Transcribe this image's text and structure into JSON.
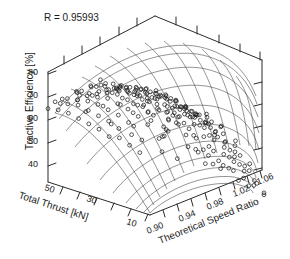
{
  "annotation": {
    "correlation_label": "R = 0.95993"
  },
  "chart_data": {
    "type": "scatter",
    "plot_style": "3d-surface-wireframe-with-scatter",
    "title": "",
    "subtitle": "",
    "annotations": [
      "R = 0.95993"
    ],
    "xlabel": "Theoretical Speed Ratio",
    "ylabel": "Total Thrust [kN]",
    "zlabel": "Tractive Efficiency [%]",
    "xticks": [
      "0.90",
      "0.94",
      "0.98",
      "1.02",
      "1.06"
    ],
    "xtick_values": [
      0.9,
      0.94,
      0.98,
      1.02,
      1.06
    ],
    "yticks": [
      "50",
      "30",
      "10"
    ],
    "ytick_values": [
      50,
      30,
      10
    ],
    "zticks": [
      "40",
      "50",
      "60",
      "70",
      "80"
    ],
    "ztick_values": [
      40,
      50,
      60,
      70,
      80
    ],
    "xlim": [
      0.9,
      1.06
    ],
    "ylim": [
      10,
      50
    ],
    "zlim": [
      35,
      88
    ],
    "grid": true,
    "legend": null,
    "legend_position": "none",
    "surface": {
      "description": "Fitted response surface of tractive efficiency; rises to a broad ridge near speed ratio 0.96-1.00 and falls steeply toward speed ratio 1.06",
      "n_u": 13,
      "n_v": 11,
      "peak_efficiency": 86,
      "min_efficiency": 38
    },
    "series": [
      {
        "name": "Measured data",
        "marker": "open-circle",
        "n_points": 196,
        "points": [
          [
            0.9,
            50,
            71
          ],
          [
            0.91,
            50,
            74
          ],
          [
            0.92,
            48,
            76
          ],
          [
            0.93,
            46,
            78
          ],
          [
            0.94,
            45,
            79
          ],
          [
            0.95,
            44,
            80
          ],
          [
            0.96,
            43,
            81
          ],
          [
            0.97,
            42,
            81
          ],
          [
            0.98,
            41,
            80
          ],
          [
            0.99,
            40,
            79
          ],
          [
            1.0,
            39,
            77
          ],
          [
            1.01,
            38,
            74
          ],
          [
            1.02,
            37,
            70
          ],
          [
            1.03,
            36,
            65
          ],
          [
            1.04,
            35,
            59
          ],
          [
            1.05,
            34,
            52
          ],
          [
            1.06,
            33,
            45
          ],
          [
            0.9,
            46,
            72
          ],
          [
            0.91,
            45,
            75
          ],
          [
            0.92,
            44,
            77
          ],
          [
            0.93,
            43,
            79
          ],
          [
            0.94,
            42,
            80
          ],
          [
            0.95,
            41,
            82
          ],
          [
            0.96,
            40,
            83
          ],
          [
            0.97,
            39,
            83
          ],
          [
            0.98,
            38,
            82
          ],
          [
            0.99,
            37,
            81
          ],
          [
            1.0,
            36,
            78
          ],
          [
            1.01,
            35,
            75
          ],
          [
            1.02,
            34,
            71
          ],
          [
            1.03,
            33,
            66
          ],
          [
            1.04,
            32,
            60
          ],
          [
            1.05,
            31,
            53
          ],
          [
            1.06,
            30,
            46
          ],
          [
            0.9,
            42,
            72
          ],
          [
            0.91,
            41,
            76
          ],
          [
            0.92,
            40,
            78
          ],
          [
            0.93,
            39,
            80
          ],
          [
            0.94,
            38,
            82
          ],
          [
            0.95,
            37,
            84
          ],
          [
            0.96,
            36,
            85
          ],
          [
            0.97,
            35,
            85
          ],
          [
            0.98,
            34,
            84
          ],
          [
            0.99,
            33,
            82
          ],
          [
            1.0,
            32,
            80
          ],
          [
            1.01,
            31,
            76
          ],
          [
            1.02,
            30,
            72
          ],
          [
            1.03,
            29,
            67
          ],
          [
            1.04,
            28,
            61
          ],
          [
            1.05,
            27,
            54
          ],
          [
            1.06,
            26,
            47
          ],
          [
            0.9,
            38,
            71
          ],
          [
            0.91,
            37,
            75
          ],
          [
            0.92,
            36,
            78
          ],
          [
            0.93,
            35,
            81
          ],
          [
            0.94,
            34,
            83
          ],
          [
            0.95,
            33,
            85
          ],
          [
            0.96,
            32,
            86
          ],
          [
            0.97,
            31,
            86
          ],
          [
            0.98,
            30,
            85
          ],
          [
            0.99,
            29,
            83
          ],
          [
            1.0,
            28,
            80
          ],
          [
            1.01,
            27,
            77
          ],
          [
            1.02,
            26,
            72
          ],
          [
            1.03,
            25,
            67
          ],
          [
            1.04,
            24,
            61
          ],
          [
            1.05,
            23,
            54
          ],
          [
            1.06,
            22,
            46
          ],
          [
            0.9,
            34,
            70
          ],
          [
            0.91,
            33,
            74
          ],
          [
            0.92,
            32,
            77
          ],
          [
            0.93,
            31,
            80
          ],
          [
            0.94,
            30,
            82
          ],
          [
            0.95,
            29,
            84
          ],
          [
            0.96,
            28,
            85
          ],
          [
            0.97,
            27,
            85
          ],
          [
            0.98,
            26,
            84
          ],
          [
            0.99,
            25,
            82
          ],
          [
            1.0,
            24,
            79
          ],
          [
            1.01,
            23,
            75
          ],
          [
            1.02,
            22,
            71
          ],
          [
            1.03,
            21,
            65
          ],
          [
            1.04,
            20,
            59
          ],
          [
            1.05,
            19,
            52
          ],
          [
            1.06,
            18,
            44
          ],
          [
            0.9,
            30,
            69
          ],
          [
            0.91,
            29,
            73
          ],
          [
            0.92,
            28,
            76
          ],
          [
            0.93,
            27,
            79
          ],
          [
            0.94,
            26,
            81
          ],
          [
            0.95,
            25,
            83
          ],
          [
            0.96,
            24,
            84
          ],
          [
            0.97,
            23,
            84
          ],
          [
            0.98,
            22,
            83
          ],
          [
            0.99,
            21,
            80
          ],
          [
            1.0,
            20,
            77
          ],
          [
            1.01,
            19,
            73
          ],
          [
            1.02,
            18,
            68
          ],
          [
            1.03,
            17,
            63
          ],
          [
            1.04,
            16,
            56
          ],
          [
            1.05,
            15,
            49
          ],
          [
            1.06,
            14,
            42
          ],
          [
            0.9,
            26,
            67
          ],
          [
            0.91,
            25,
            71
          ],
          [
            0.92,
            24,
            74
          ],
          [
            0.93,
            23,
            77
          ],
          [
            0.94,
            22,
            79
          ],
          [
            0.95,
            21,
            81
          ],
          [
            0.96,
            20,
            82
          ],
          [
            0.97,
            19,
            82
          ],
          [
            0.98,
            18,
            80
          ],
          [
            0.99,
            17,
            78
          ],
          [
            1.0,
            16,
            74
          ],
          [
            1.01,
            15,
            70
          ],
          [
            1.02,
            14,
            65
          ],
          [
            1.03,
            13,
            60
          ],
          [
            1.04,
            12,
            53
          ],
          [
            1.05,
            11,
            46
          ],
          [
            1.06,
            10,
            39
          ],
          [
            0.92,
            50,
            75
          ],
          [
            0.94,
            50,
            78
          ],
          [
            0.96,
            50,
            80
          ],
          [
            0.98,
            50,
            79
          ],
          [
            1.0,
            50,
            76
          ],
          [
            1.02,
            50,
            69
          ],
          [
            1.04,
            50,
            58
          ],
          [
            1.06,
            50,
            44
          ],
          [
            0.92,
            10,
            73
          ],
          [
            0.94,
            10,
            78
          ],
          [
            0.96,
            10,
            81
          ],
          [
            0.98,
            10,
            80
          ],
          [
            1.0,
            10,
            75
          ],
          [
            1.02,
            10,
            67
          ],
          [
            1.04,
            10,
            55
          ],
          [
            1.06,
            10,
            40
          ],
          [
            0.93,
            47,
            79
          ],
          [
            0.95,
            47,
            81
          ],
          [
            0.97,
            47,
            82
          ],
          [
            0.99,
            47,
            80
          ],
          [
            1.01,
            47,
            75
          ],
          [
            1.03,
            47,
            66
          ],
          [
            1.05,
            47,
            53
          ],
          [
            0.93,
            13,
            76
          ],
          [
            0.95,
            13,
            80
          ],
          [
            0.97,
            13,
            82
          ],
          [
            0.99,
            13,
            80
          ],
          [
            1.01,
            13,
            73
          ],
          [
            1.03,
            13,
            63
          ],
          [
            1.05,
            13,
            50
          ],
          [
            0.91,
            48,
            74
          ],
          [
            0.91,
            20,
            70
          ],
          [
            0.92,
            22,
            73
          ],
          [
            0.93,
            30,
            80
          ],
          [
            0.94,
            36,
            83
          ],
          [
            0.95,
            32,
            84
          ],
          [
            0.96,
            26,
            84
          ],
          [
            0.97,
            44,
            83
          ],
          [
            0.98,
            28,
            83
          ],
          [
            0.99,
            35,
            82
          ],
          [
            1.0,
            44,
            78
          ],
          [
            1.01,
            29,
            75
          ],
          [
            1.02,
            40,
            70
          ],
          [
            1.03,
            23,
            64
          ],
          [
            1.04,
            31,
            59
          ],
          [
            1.05,
            37,
            52
          ],
          [
            1.06,
            27,
            45
          ],
          [
            0.9,
            18,
            66
          ],
          [
            0.9,
            14,
            64
          ],
          [
            0.91,
            16,
            69
          ],
          [
            0.92,
            12,
            71
          ],
          [
            0.93,
            18,
            77
          ],
          [
            0.94,
            14,
            79
          ],
          [
            0.95,
            17,
            81
          ],
          [
            0.96,
            12,
            81
          ],
          [
            0.97,
            16,
            82
          ],
          [
            0.98,
            13,
            80
          ],
          [
            0.99,
            11,
            77
          ],
          [
            1.0,
            15,
            74
          ],
          [
            1.01,
            12,
            70
          ],
          [
            1.02,
            17,
            66
          ],
          [
            1.03,
            11,
            59
          ],
          [
            1.04,
            14,
            53
          ],
          [
            1.05,
            10,
            45
          ],
          [
            1.06,
            16,
            41
          ],
          [
            0.94,
            48,
            79
          ],
          [
            0.96,
            46,
            82
          ],
          [
            0.98,
            44,
            81
          ],
          [
            1.0,
            42,
            77
          ],
          [
            1.02,
            46,
            70
          ],
          [
            1.04,
            42,
            58
          ],
          [
            1.06,
            44,
            43
          ],
          [
            0.95,
            38,
            84
          ],
          [
            0.97,
            33,
            85
          ],
          [
            0.99,
            27,
            82
          ],
          [
            1.01,
            21,
            73
          ],
          [
            1.03,
            39,
            65
          ],
          [
            1.05,
            25,
            50
          ],
          [
            0.92,
            34,
            78
          ],
          [
            0.94,
            24,
            81
          ],
          [
            0.96,
            18,
            82
          ],
          [
            0.98,
            36,
            83
          ],
          [
            1.0,
            30,
            79
          ],
          [
            1.02,
            24,
            69
          ],
          [
            1.04,
            18,
            55
          ],
          [
            0.91,
            28,
            72
          ],
          [
            0.93,
            41,
            80
          ],
          [
            0.95,
            15,
            80
          ],
          [
            0.97,
            26,
            84
          ],
          [
            0.99,
            43,
            81
          ],
          [
            1.01,
            17,
            71
          ],
          [
            1.03,
            31,
            64
          ],
          [
            1.05,
            21,
            48
          ],
          [
            0.9,
            22,
            68
          ],
          [
            0.92,
            44,
            77
          ],
          [
            0.94,
            32,
            82
          ],
          [
            0.96,
            38,
            85
          ],
          [
            0.98,
            20,
            81
          ],
          [
            1.0,
            26,
            78
          ],
          [
            1.02,
            32,
            70
          ],
          [
            1.04,
            26,
            57
          ],
          [
            1.06,
            20,
            42
          ],
          [
            0.93,
            25,
            78
          ],
          [
            0.95,
            45,
            82
          ],
          [
            0.97,
            11,
            81
          ],
          [
            0.99,
            19,
            79
          ],
          [
            1.01,
            41,
            74
          ],
          [
            1.03,
            15,
            60
          ],
          [
            1.05,
            33,
            51
          ],
          [
            0.91,
            38,
            74
          ],
          [
            0.93,
            12,
            75
          ],
          [
            0.95,
            27,
            83
          ],
          [
            0.97,
            49,
            83
          ],
          [
            0.99,
            31,
            82
          ],
          [
            1.01,
            25,
            73
          ],
          [
            1.03,
            45,
            65
          ],
          [
            1.05,
            29,
            51
          ]
        ]
      }
    ]
  }
}
